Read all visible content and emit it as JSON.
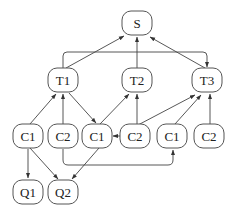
{
  "diagram": {
    "type": "directed-graph",
    "nodes": [
      {
        "id": "S",
        "label": "S",
        "x": 137,
        "y": 23
      },
      {
        "id": "T1",
        "label": "T1",
        "x": 63,
        "y": 80
      },
      {
        "id": "T2",
        "label": "T2",
        "x": 137,
        "y": 80
      },
      {
        "id": "T3",
        "label": "T3",
        "x": 207,
        "y": 80
      },
      {
        "id": "C1a",
        "label": "C1",
        "x": 28,
        "y": 136
      },
      {
        "id": "C2a",
        "label": "C2",
        "x": 63,
        "y": 136
      },
      {
        "id": "C1b",
        "label": "C1",
        "x": 97,
        "y": 136
      },
      {
        "id": "C2b",
        "label": "C2",
        "x": 135,
        "y": 136
      },
      {
        "id": "C1c",
        "label": "C1",
        "x": 172,
        "y": 136
      },
      {
        "id": "C2c",
        "label": "C2",
        "x": 209,
        "y": 136
      },
      {
        "id": "Q1",
        "label": "Q1",
        "x": 28,
        "y": 192
      },
      {
        "id": "Q2",
        "label": "Q2",
        "x": 63,
        "y": 192
      }
    ],
    "edges": [
      {
        "from": "T1",
        "to": "S"
      },
      {
        "from": "T2",
        "to": "S"
      },
      {
        "from": "T3",
        "to": "S"
      },
      {
        "from": "T1",
        "to": "T3",
        "routed": "over-top"
      },
      {
        "from": "C1a",
        "to": "T1"
      },
      {
        "from": "C2a",
        "to": "T1"
      },
      {
        "from": "T1",
        "to": "C1b"
      },
      {
        "from": "C1b",
        "to": "T2"
      },
      {
        "from": "C2b",
        "to": "T2"
      },
      {
        "from": "C2b",
        "to": "T3"
      },
      {
        "from": "C1c",
        "to": "T3"
      },
      {
        "from": "C2c",
        "to": "T3"
      },
      {
        "from": "C2b",
        "to": "C1b"
      },
      {
        "from": "C2a",
        "to": "C1c",
        "routed": "under-bottom"
      },
      {
        "from": "C1a",
        "to": "Q1"
      },
      {
        "from": "C1a",
        "to": "Q2"
      },
      {
        "from": "C1b",
        "to": "Q2"
      }
    ]
  }
}
